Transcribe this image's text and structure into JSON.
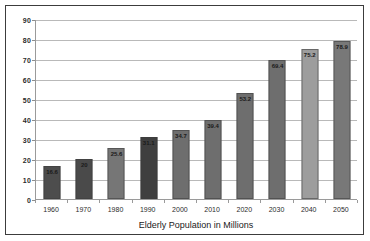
{
  "chart_data": {
    "type": "bar",
    "title": "",
    "xlabel": "Elderly Population in Millions",
    "ylabel": "",
    "categories": [
      "1960",
      "1970",
      "1980",
      "1990",
      "2000",
      "2010",
      "2020",
      "2030",
      "2040",
      "2050"
    ],
    "values": [
      16.6,
      20,
      25.6,
      31.1,
      34.7,
      39.4,
      53.2,
      69.4,
      75.2,
      78.9
    ],
    "data_labels": [
      "16.6",
      "20",
      "25.6",
      "31.1",
      "34.7",
      "39.4",
      "53.2",
      "69.4",
      "75.2",
      "78.9"
    ],
    "bar_colors": [
      "#4d4d4d",
      "#4a4a4a",
      "#767676",
      "#3f3f3f",
      "#6e6e6e",
      "#6e6e6e",
      "#6e6e6e",
      "#6e6e6e",
      "#9d9d9d",
      "#787878"
    ],
    "ylim": [
      0,
      90
    ],
    "yticks": [
      0,
      10,
      20,
      30,
      40,
      50,
      60,
      70,
      80,
      90
    ],
    "ytick_labels": [
      "0",
      "10",
      "20",
      "30",
      "40",
      "50",
      "60",
      "70",
      "80",
      "90"
    ],
    "grid": true,
    "legend": false,
    "legend_position": "none"
  },
  "figure": {
    "border_color": "#3c3c3c",
    "background": "#ffffff",
    "gridline_color": "#b9b9b9",
    "axis_color": "#9a9a9a"
  }
}
